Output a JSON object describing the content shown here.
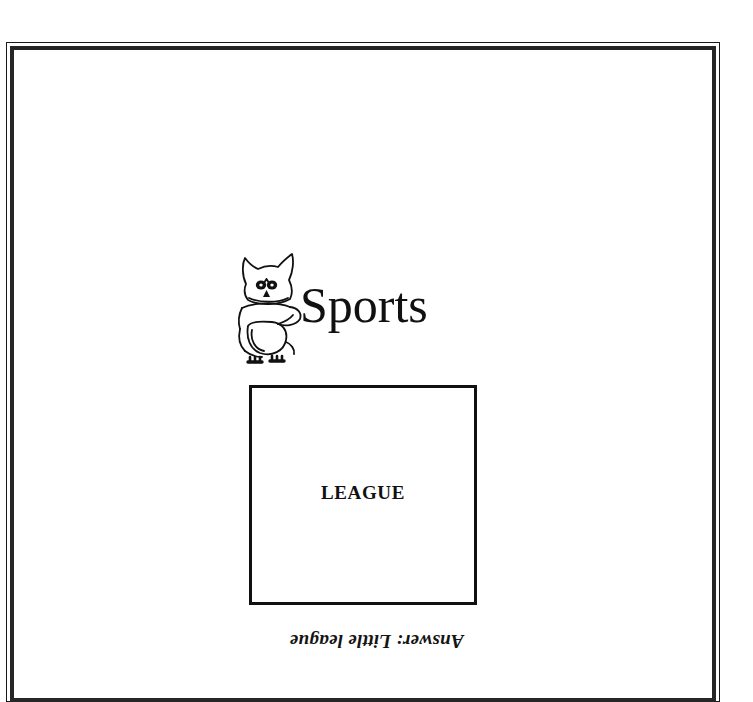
{
  "page": {
    "background_color": "#ffffff",
    "ink_color": "#111111",
    "frame_color": "#262626"
  },
  "frame": {
    "name": "double-rule-page-border",
    "outer_line_width_px": 1,
    "inner_line_width_px": 4
  },
  "logo": {
    "mascot_icon_name": "owl-mascot-line-drawing",
    "wordmark": "Sports"
  },
  "puzzle": {
    "box_word": "LEAGUE",
    "box_border_color": "#111111"
  },
  "answer_key": {
    "text": "Answer: Little league",
    "orientation": "rotated-180"
  }
}
